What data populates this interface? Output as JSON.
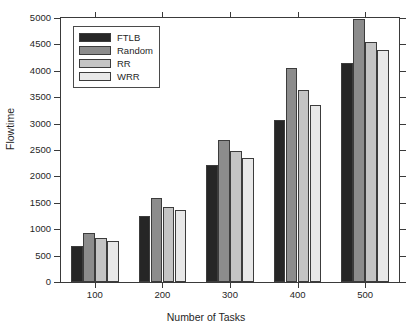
{
  "chart_data": {
    "type": "bar",
    "title": "",
    "xlabel": "Number of Tasks",
    "ylabel": "Flowtime",
    "categories": [
      "100",
      "200",
      "300",
      "400",
      "500"
    ],
    "series": [
      {
        "name": "FTLB",
        "color": "#262626",
        "values": [
          690,
          1255,
          2210,
          3065,
          4155
        ]
      },
      {
        "name": "Random",
        "color": "#8c8c8c",
        "values": [
          935,
          1590,
          2690,
          4060,
          4985
        ]
      },
      {
        "name": "RR",
        "color": "#c4c4c4",
        "values": [
          840,
          1420,
          2490,
          3645,
          4540
        ]
      },
      {
        "name": "WRR",
        "color": "#e8e8e8",
        "values": [
          775,
          1355,
          2355,
          3345,
          4395
        ]
      }
    ],
    "ylim": [
      0,
      5000
    ],
    "yticks": [
      0,
      500,
      1000,
      1500,
      2000,
      2500,
      3000,
      3500,
      4000,
      4500,
      5000
    ],
    "ytick_labels": [
      "0",
      "500",
      "1000",
      "1500",
      "2000",
      "2500",
      "3000",
      "3500",
      "4000",
      "4500",
      "5000"
    ],
    "grid": false,
    "legend_position": "upper left"
  },
  "axes": {
    "y_title": "Flowtime",
    "x_title": "Number of Tasks"
  },
  "legend": {
    "entries": [
      {
        "label": "FTLB"
      },
      {
        "label": "Random"
      },
      {
        "label": "RR"
      },
      {
        "label": "WRR"
      }
    ]
  }
}
